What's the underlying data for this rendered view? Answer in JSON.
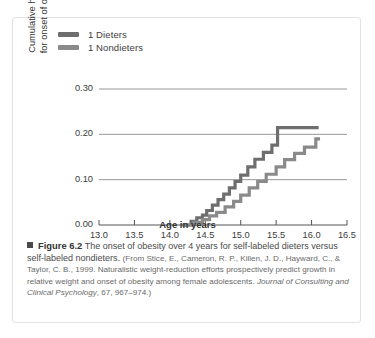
{
  "figure": {
    "number_label": "Figure 6.2",
    "bullet_icon": "square-bullet-icon",
    "main_caption": "The onset of obesity over 4 years for self-labeled dieters versus self-labeled nondieters.",
    "source_prefix": "(From Stice, E., Cameron, R. P., Killen, J. D., Hayward, C., & Taylor, C. B., 1999. Naturalistic weight-reduction efforts prospectively predict growth in relative weight and onset of obesity among female adolescents. ",
    "source_journal": "Journal of Consulting and Clinical Psychology",
    "source_suffix": ", 67, 967–974.)"
  },
  "chart_data": {
    "type": "line",
    "title": "",
    "xlabel": "Age in years",
    "ylabel": "Cumulative hazard for onset of obesity",
    "ylabel_line1": "Cumulative hazard",
    "ylabel_line2": "for onset of obesity",
    "xlim": [
      13.0,
      16.5
    ],
    "ylim": [
      0.0,
      0.3
    ],
    "xticks": [
      "13.0",
      "13.5",
      "14.0",
      "14.5",
      "15.0",
      "15.5",
      "16.0",
      "16.5"
    ],
    "xtick_values": [
      13.0,
      13.5,
      14.0,
      14.5,
      15.0,
      15.5,
      16.0,
      16.5
    ],
    "yticks": [
      "0.00",
      "0.10",
      "0.20",
      "0.30"
    ],
    "ytick_values": [
      0.0,
      0.1,
      0.2,
      0.3
    ],
    "grid": "horizontal",
    "legend_position": "top-left",
    "series": [
      {
        "name": "1 Dieters",
        "color": "#6e6e6e",
        "step": "post",
        "x": [
          14.18,
          14.3,
          14.38,
          14.46,
          14.52,
          14.6,
          14.68,
          14.76,
          14.84,
          14.92,
          15.0,
          15.1,
          15.2,
          15.32,
          15.44,
          15.52,
          16.1
        ],
        "y": [
          0.0,
          0.008,
          0.016,
          0.022,
          0.032,
          0.044,
          0.056,
          0.068,
          0.082,
          0.096,
          0.11,
          0.128,
          0.145,
          0.16,
          0.176,
          0.215,
          0.215
        ]
      },
      {
        "name": "1 Nondieters",
        "color": "#8a8a8a",
        "step": "post",
        "x": [
          14.18,
          14.34,
          14.46,
          14.56,
          14.66,
          14.78,
          14.9,
          15.0,
          15.12,
          15.24,
          15.36,
          15.5,
          15.62,
          15.76,
          15.9,
          16.06,
          16.12
        ],
        "y": [
          0.0,
          0.006,
          0.012,
          0.02,
          0.028,
          0.04,
          0.052,
          0.066,
          0.082,
          0.096,
          0.112,
          0.128,
          0.144,
          0.158,
          0.172,
          0.19,
          0.19
        ]
      }
    ]
  },
  "legend": {
    "items": [
      {
        "label": "1 Dieters",
        "color": "#6e6e6e"
      },
      {
        "label": "1 Nondieters",
        "color": "#8a8a8a"
      }
    ]
  },
  "colors": {
    "dieters": "#6e6e6e",
    "nondieters": "#8a8a8a",
    "axis": "#555555",
    "grid": "#7a7a7a",
    "border": "#e2e2e2",
    "background": "#ffffff"
  }
}
